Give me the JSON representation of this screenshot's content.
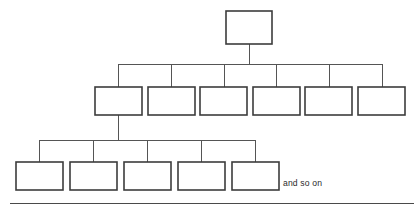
{
  "diagram": {
    "kind": "organization-hierarchy-tree",
    "background_color": "#ffffff",
    "box_fill_color": "#ffffff",
    "box_stroke_color": "#3c3c3c",
    "connector_color": "#555555",
    "rule_color": "#4a4a4a",
    "caption": "and so on",
    "levels": [
      {
        "name": "level-1",
        "box_count": 1,
        "boxes": [
          {
            "label": "",
            "x": 226,
            "y": 11,
            "w": 46,
            "h": 33
          }
        ]
      },
      {
        "name": "level-2",
        "box_count": 6,
        "boxes": [
          {
            "label": "",
            "x": 95,
            "y": 87,
            "w": 47,
            "h": 28
          },
          {
            "label": "",
            "x": 148,
            "y": 87,
            "w": 47,
            "h": 28
          },
          {
            "label": "",
            "x": 200,
            "y": 87,
            "w": 47,
            "h": 28
          },
          {
            "label": "",
            "x": 253,
            "y": 87,
            "w": 47,
            "h": 28
          },
          {
            "label": "",
            "x": 305,
            "y": 87,
            "w": 47,
            "h": 28
          },
          {
            "label": "",
            "x": 358,
            "y": 87,
            "w": 47,
            "h": 28
          }
        ]
      },
      {
        "name": "level-3",
        "box_count": 5,
        "boxes": [
          {
            "label": "",
            "x": 16,
            "y": 162,
            "w": 47,
            "h": 28
          },
          {
            "label": "",
            "x": 70,
            "y": 162,
            "w": 47,
            "h": 28
          },
          {
            "label": "",
            "x": 124,
            "y": 162,
            "w": 47,
            "h": 28
          },
          {
            "label": "",
            "x": 178,
            "y": 162,
            "w": 47,
            "h": 28
          },
          {
            "label": "",
            "x": 232,
            "y": 162,
            "w": 47,
            "h": 28
          }
        ]
      }
    ],
    "connectors": {
      "level1_stem": {
        "x": 249,
        "y1": 44,
        "y2": 64
      },
      "level2_bus": {
        "y": 64,
        "x1": 118,
        "x2": 382
      },
      "level2_drops": [
        118,
        171,
        224,
        276,
        329,
        382
      ],
      "level2_drop_y1": 64,
      "level2_drop_y2": 87,
      "level3_stem": {
        "x": 118,
        "y1": 115,
        "y2": 140
      },
      "level3_bus": {
        "y": 140,
        "x1": 39,
        "x2": 255
      },
      "level3_drops": [
        39,
        93,
        147,
        201,
        255
      ],
      "level3_drop_y1": 140,
      "level3_drop_y2": 162
    },
    "baseline_rule": {
      "x1": 10,
      "x2": 414,
      "y": 203
    },
    "caption_position": {
      "x": 283,
      "y": 186
    }
  }
}
